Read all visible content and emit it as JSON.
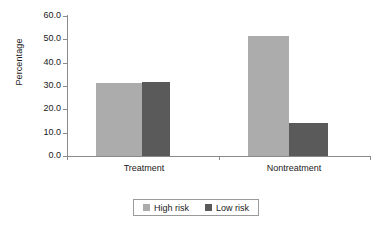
{
  "chart_data": {
    "type": "bar",
    "title": "",
    "subtitle": "",
    "xlabel": "",
    "ylabel": "Percentage",
    "categories": [
      "Treatment",
      "Nontreatment"
    ],
    "series": [
      {
        "name": "High risk",
        "color": "#acacac",
        "values": [
          31.3,
          51.5
        ]
      },
      {
        "name": "Low risk",
        "color": "#5a5a5a",
        "values": [
          31.8,
          14.0
        ]
      }
    ],
    "ylim": [
      0.0,
      60.0
    ],
    "ytick_step": 10.0,
    "ytick_labels": [
      "60.0",
      "50.0",
      "40.0",
      "30.0",
      "20.0",
      "10.0",
      "0.0"
    ],
    "ytick_values": [
      60.0,
      50.0,
      40.0,
      30.0,
      20.0,
      10.0,
      0.0
    ],
    "grid": false,
    "legend_position": "bottom-center",
    "legend_entries": [
      "High risk",
      "Low risk"
    ]
  },
  "axis": {
    "y_title": "Percentage"
  },
  "categories": {
    "treatment": "Treatment",
    "nontreatment": "Nontreatment"
  },
  "legend": {
    "high_risk": "High risk",
    "low_risk": "Low risk"
  },
  "yticks": {
    "t60": "60.0",
    "t50": "50.0",
    "t40": "40.0",
    "t30": "30.0",
    "t20": "20.0",
    "t10": "10.0",
    "t0": "0.0"
  }
}
